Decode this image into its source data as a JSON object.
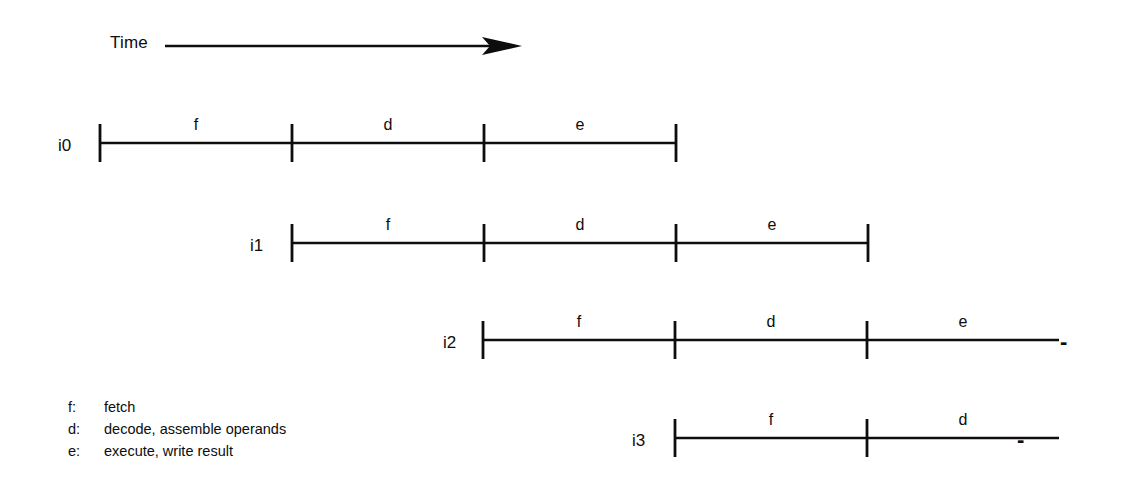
{
  "figure": {
    "type": "timing-diagram",
    "title_axis": "Time",
    "background": "#ffffff",
    "ink_color": "#0d0d0d"
  },
  "time_axis": {
    "label": "Time",
    "arrow_direction": "right",
    "x_start_px": 165,
    "x_end_px": 518,
    "y_px": 45
  },
  "geometry": {
    "segment_width_px": 192,
    "tick_half_height_px": 19,
    "baseline_ys": [
      143,
      243,
      340,
      438
    ],
    "row_start_x": [
      100,
      292,
      483,
      675
    ]
  },
  "instructions": [
    {
      "label": "i0",
      "label_x": 58,
      "baseline_y": 143,
      "start_x": 100,
      "stages": [
        {
          "letter": "f",
          "ticked_end": true
        },
        {
          "letter": "d",
          "ticked_end": true
        },
        {
          "letter": "e",
          "ticked_end": true
        }
      ],
      "trailing_dash": false
    },
    {
      "label": "i1",
      "label_x": 250,
      "baseline_y": 243,
      "start_x": 292,
      "stages": [
        {
          "letter": "f",
          "ticked_end": true
        },
        {
          "letter": "d",
          "ticked_end": true
        },
        {
          "letter": "e",
          "ticked_end": true
        }
      ],
      "trailing_dash": false
    },
    {
      "label": "i2",
      "label_x": 443,
      "baseline_y": 340,
      "start_x": 483,
      "stages": [
        {
          "letter": "f",
          "ticked_end": true
        },
        {
          "letter": "d",
          "ticked_end": true
        },
        {
          "letter": "e",
          "ticked_end": false
        }
      ],
      "trailing_dash": true,
      "dash_x": 1060
    },
    {
      "label": "i3",
      "label_x": 632,
      "baseline_y": 438,
      "start_x": 675,
      "stages": [
        {
          "letter": "f",
          "ticked_end": true
        },
        {
          "letter": "d",
          "ticked_end": false
        }
      ],
      "trailing_dash": true,
      "dash_x": 1017
    }
  ],
  "legend": {
    "items": [
      {
        "key": "f:",
        "desc": "fetch"
      },
      {
        "key": "d:",
        "desc": "decode, assemble operands"
      },
      {
        "key": "e:",
        "desc": "execute, write result"
      }
    ]
  }
}
